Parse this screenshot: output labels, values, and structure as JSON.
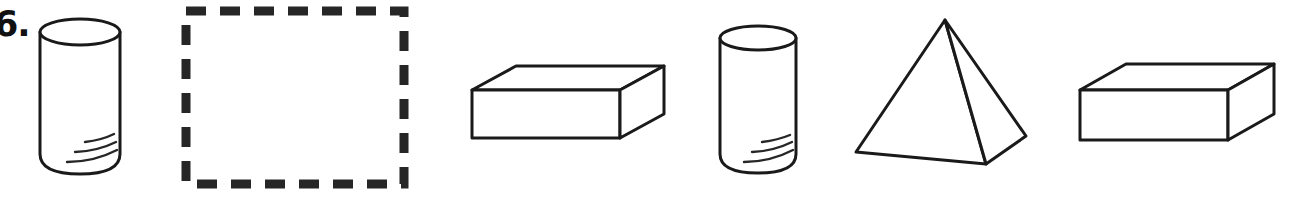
{
  "page": {
    "background_color": "#ffffff",
    "ink_color": "#1a1a1a",
    "width": 1289,
    "height": 207
  },
  "problem": {
    "number_label": "6.",
    "type": "pattern-completion",
    "answer_box": {
      "state": "empty",
      "border_style": "dashed",
      "border_color": "#262626",
      "x": 181,
      "y": 6,
      "width": 228,
      "height": 183
    }
  },
  "figures": [
    {
      "index": 1,
      "name": "cylinder",
      "label": "cylinder",
      "position": "slot-1",
      "x": 38,
      "y": 22,
      "width": 82,
      "height": 152,
      "detail_lines": 3
    },
    {
      "index": 2,
      "name": "answer-box",
      "label": "missing figure",
      "position": "slot-2",
      "x": 181,
      "y": 6,
      "width": 228,
      "height": 183
    },
    {
      "index": 3,
      "name": "rectangular-prism",
      "label": "rectangular prism",
      "position": "slot-3",
      "x": 470,
      "y": 62,
      "width": 196,
      "height": 82
    },
    {
      "index": 4,
      "name": "cylinder",
      "label": "cylinder",
      "position": "slot-4",
      "x": 716,
      "y": 28,
      "width": 78,
      "height": 146,
      "detail_lines": 3
    },
    {
      "index": 5,
      "name": "pyramid",
      "label": "square pyramid",
      "position": "slot-5",
      "x": 852,
      "y": 18,
      "width": 178,
      "height": 148
    },
    {
      "index": 6,
      "name": "rectangular-prism",
      "label": "rectangular prism",
      "position": "slot-6",
      "x": 1078,
      "y": 60,
      "width": 196,
      "height": 84
    }
  ]
}
